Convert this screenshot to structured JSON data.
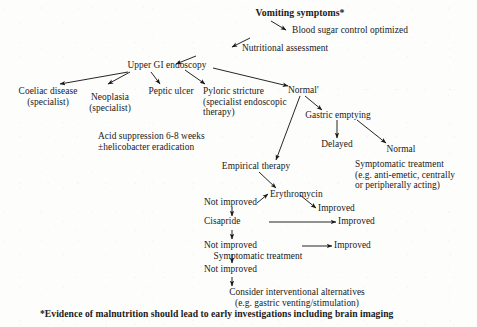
{
  "diagram": {
    "type": "clinical-algorithm-flowchart",
    "title": "Vomiting symptoms*",
    "footnote": "*Evidence of malnutrition should lead to early investigations including brain imaging",
    "nodes": [
      {
        "id": "vomiting",
        "label": "Vomiting symptoms*"
      },
      {
        "id": "blood-sugar",
        "label": "Blood sugar control optimized"
      },
      {
        "id": "nutritional",
        "label": "Nutritional assessment"
      },
      {
        "id": "endoscopy",
        "label": "Upper GI endoscopy"
      },
      {
        "id": "coeliac",
        "label": "Coeliac disease\n(specialist)"
      },
      {
        "id": "neoplasia",
        "label": "Neoplasia\n(specialist)"
      },
      {
        "id": "peptic",
        "label": "Peptic ulcer"
      },
      {
        "id": "pyloric",
        "label": "Pyloric stricture\n(specialist endoscopic\ntherapy)"
      },
      {
        "id": "acid",
        "label": "Acid suppression 6-8 weeks\n±helicobacter eradication"
      },
      {
        "id": "normal-endo",
        "label": "Normal'"
      },
      {
        "id": "gastric",
        "label": "Gastric emptying"
      },
      {
        "id": "delayed",
        "label": "Delayed"
      },
      {
        "id": "normal-empty",
        "label": "Normal"
      },
      {
        "id": "symptomatic-rx",
        "label": "Symptomatic treatment\n(e.g. anti-emetic, centrally\nor peripherally acting)"
      },
      {
        "id": "empirical",
        "label": "Empirical therapy"
      },
      {
        "id": "erythromycin",
        "label": "Erythromycin"
      },
      {
        "id": "improved-1",
        "label": "Improved"
      },
      {
        "id": "not-improved-1",
        "label": "Not improved"
      },
      {
        "id": "cisapride",
        "label": "Cisapride"
      },
      {
        "id": "improved-2",
        "label": "Improved"
      },
      {
        "id": "not-improved-2",
        "label": "Not improved"
      },
      {
        "id": "symptomatic-2",
        "label": "Symptomatic treatment"
      },
      {
        "id": "improved-3",
        "label": "Improved"
      },
      {
        "id": "not-improved-3",
        "label": "Not improved"
      },
      {
        "id": "interventional",
        "label": "Consider interventional alternatives\n(e.g. gastric venting/stimulation)"
      }
    ],
    "colors": {
      "text": "#1a1a1a",
      "arrow": "#1a1a1a",
      "background": "#fdfdfc"
    }
  }
}
